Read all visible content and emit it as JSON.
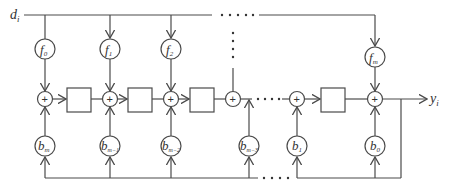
{
  "diagram": {
    "input_label": "d",
    "input_sub": "i",
    "output_label": "y",
    "output_sub": "i",
    "adder_symbol": "+",
    "f_nodes": [
      {
        "base": "f",
        "sub": "0"
      },
      {
        "base": "f",
        "sub": "1"
      },
      {
        "base": "f",
        "sub": "2"
      },
      {
        "base": "f",
        "sub": "m"
      }
    ],
    "b_nodes": [
      {
        "base": "b",
        "sub": "m"
      },
      {
        "base": "b",
        "sub": "m−1"
      },
      {
        "base": "b",
        "sub": "m−2"
      },
      {
        "base": "b",
        "sub": "m−3"
      },
      {
        "base": "b",
        "sub": "1"
      },
      {
        "base": "b",
        "sub": "0"
      }
    ],
    "ellipsis": "· · · · ·"
  }
}
